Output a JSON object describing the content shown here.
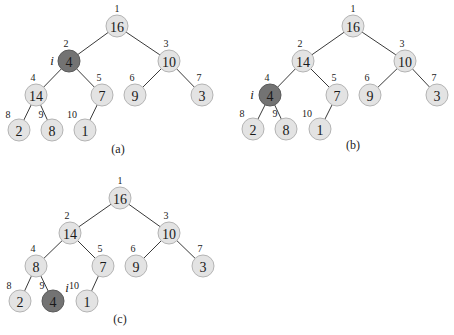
{
  "trees": [
    {
      "caption": "(a)",
      "pointer_label": "i",
      "highlight_index": 2,
      "pointer_pos": [
        52,
        65
      ],
      "caption_pos": [
        118,
        153
      ],
      "nodes": [
        {
          "index": "1",
          "value": "16",
          "x": 117,
          "y": 26
        },
        {
          "index": "2",
          "value": "4",
          "x": 69,
          "y": 61
        },
        {
          "index": "3",
          "value": "10",
          "x": 169,
          "y": 61
        },
        {
          "index": "4",
          "value": "14",
          "x": 36,
          "y": 95
        },
        {
          "index": "5",
          "value": "7",
          "x": 102,
          "y": 95
        },
        {
          "index": "6",
          "value": "9",
          "x": 135,
          "y": 95
        },
        {
          "index": "7",
          "value": "3",
          "x": 202,
          "y": 95
        },
        {
          "index": "8",
          "value": "2",
          "x": 19,
          "y": 130
        },
        {
          "index": "9",
          "value": "8",
          "x": 52,
          "y": 130
        },
        {
          "index": "10",
          "value": "1",
          "x": 85,
          "y": 130
        }
      ]
    },
    {
      "caption": "(b)",
      "pointer_label": "i",
      "highlight_index": 4,
      "pointer_pos": [
        252,
        99
      ],
      "caption_pos": [
        353,
        149
      ],
      "nodes": [
        {
          "index": "1",
          "value": "16",
          "x": 353,
          "y": 26
        },
        {
          "index": "2",
          "value": "14",
          "x": 303,
          "y": 61
        },
        {
          "index": "3",
          "value": "10",
          "x": 405,
          "y": 61
        },
        {
          "index": "4",
          "value": "4",
          "x": 270,
          "y": 95
        },
        {
          "index": "5",
          "value": "7",
          "x": 337,
          "y": 95
        },
        {
          "index": "6",
          "value": "9",
          "x": 370,
          "y": 95
        },
        {
          "index": "7",
          "value": "3",
          "x": 437,
          "y": 95
        },
        {
          "index": "8",
          "value": "2",
          "x": 253,
          "y": 129
        },
        {
          "index": "9",
          "value": "8",
          "x": 286,
          "y": 129
        },
        {
          "index": "10",
          "value": "1",
          "x": 320,
          "y": 129
        }
      ]
    },
    {
      "caption": "(c)",
      "pointer_label": "i",
      "highlight_index": 9,
      "pointer_pos": [
        67,
        292
      ],
      "caption_pos": [
        120,
        323
      ],
      "nodes": [
        {
          "index": "1",
          "value": "16",
          "x": 120,
          "y": 198
        },
        {
          "index": "2",
          "value": "14",
          "x": 70,
          "y": 233
        },
        {
          "index": "3",
          "value": "10",
          "x": 169,
          "y": 233
        },
        {
          "index": "4",
          "value": "8",
          "x": 36,
          "y": 266
        },
        {
          "index": "5",
          "value": "7",
          "x": 103,
          "y": 266
        },
        {
          "index": "6",
          "value": "9",
          "x": 136,
          "y": 266
        },
        {
          "index": "7",
          "value": "3",
          "x": 203,
          "y": 266
        },
        {
          "index": "8",
          "value": "2",
          "x": 20,
          "y": 301
        },
        {
          "index": "9",
          "value": "4",
          "x": 53,
          "y": 301
        },
        {
          "index": "10",
          "value": "1",
          "x": 87,
          "y": 301
        }
      ]
    }
  ],
  "colors": {
    "node_fill": "#e3e3e3",
    "node_stroke": "#b4b4b4",
    "highlight_fill": "#737373",
    "edge": "#3a3a3a"
  }
}
